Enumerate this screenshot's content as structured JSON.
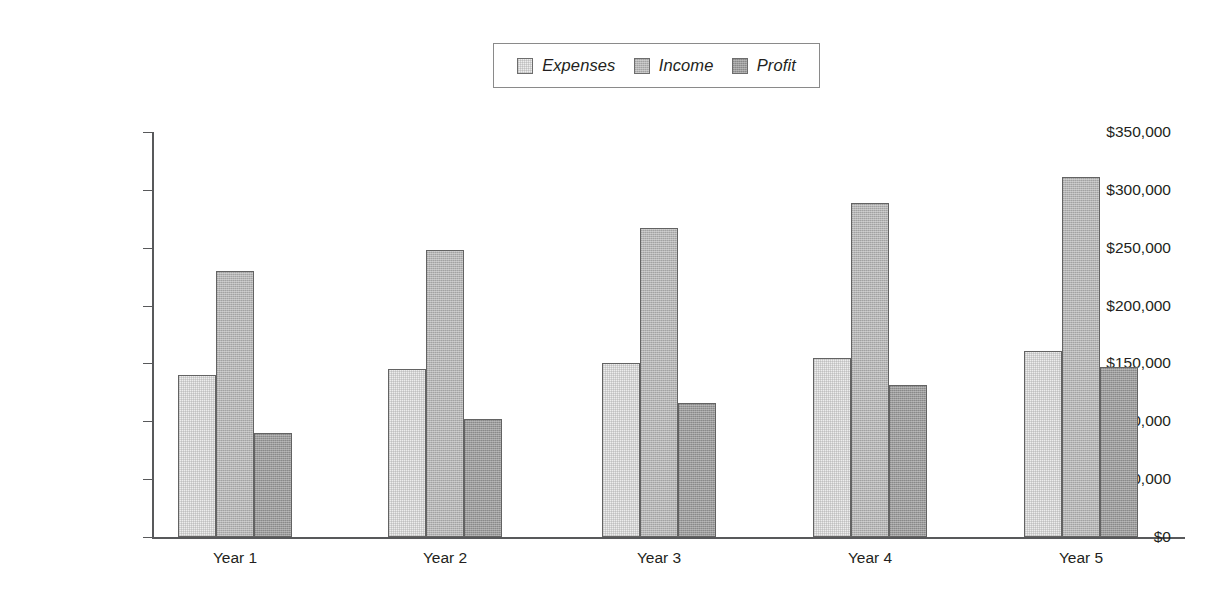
{
  "chart_data": {
    "type": "bar",
    "title": "",
    "xlabel": "",
    "ylabel": "",
    "categories": [
      "Year 1",
      "Year 2",
      "Year 3",
      "Year 4",
      "Year 5"
    ],
    "series": [
      {
        "name": "Expenses",
        "color": "#ededed",
        "values": [
          140000,
          145000,
          150000,
          155000,
          161000
        ]
      },
      {
        "name": "Income",
        "color": "#b4b4b4",
        "values": [
          230000,
          248000,
          267000,
          289000,
          311000
        ]
      },
      {
        "name": "Profit",
        "color": "#9b9b9b",
        "values": [
          90000,
          102000,
          116000,
          131000,
          147000
        ]
      }
    ],
    "ylim": [
      0,
      350000
    ],
    "ytick_values": [
      0,
      50000,
      100000,
      150000,
      200000,
      250000,
      300000,
      350000
    ],
    "ytick_labels": [
      "$0",
      "$50,000",
      "$100,000",
      "$150,000",
      "$200,000",
      "$250,000",
      "$300,000",
      "$350,000"
    ],
    "grid": false,
    "legend_position": "top-center",
    "legend_entries": [
      "Expenses",
      "Income",
      "Profit"
    ]
  }
}
